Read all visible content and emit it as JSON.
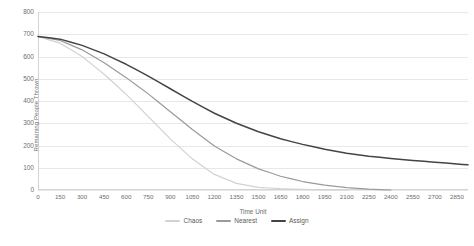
{
  "chart_data": {
    "type": "line",
    "title": "",
    "xlabel": "Time Unit",
    "ylabel": "Remaining People Thrown",
    "xlim": [
      0,
      2925
    ],
    "ylim": [
      0,
      800
    ],
    "grid": true,
    "legend_position": "bottom",
    "x_ticks": [
      0,
      150,
      300,
      450,
      600,
      750,
      900,
      1050,
      1200,
      1350,
      1500,
      1650,
      1800,
      1950,
      2100,
      2250,
      2400,
      2550,
      2700,
      2850
    ],
    "y_ticks": [
      0,
      100,
      200,
      300,
      400,
      500,
      600,
      700,
      800
    ],
    "series": [
      {
        "name": "Chaos",
        "color": "#d2d2d2",
        "x": [
          0,
          150,
          300,
          450,
          600,
          750,
          900,
          1050,
          1200,
          1350,
          1500,
          1650,
          1800,
          1950,
          2100
        ],
        "values": [
          690,
          660,
          600,
          520,
          430,
          330,
          230,
          140,
          70,
          30,
          12,
          6,
          3,
          1,
          0
        ]
      },
      {
        "name": "Nearest",
        "color": "#9a9a9a",
        "x": [
          0,
          150,
          300,
          450,
          600,
          750,
          900,
          1050,
          1200,
          1350,
          1500,
          1650,
          1800,
          1950,
          2100,
          2250,
          2400
        ],
        "values": [
          690,
          672,
          630,
          572,
          505,
          432,
          352,
          272,
          198,
          140,
          95,
          62,
          38,
          22,
          11,
          4,
          0
        ]
      },
      {
        "name": "Assign",
        "color": "#444444",
        "x": [
          0,
          150,
          300,
          450,
          600,
          750,
          900,
          1050,
          1200,
          1350,
          1500,
          1650,
          1800,
          1950,
          2100,
          2250,
          2400,
          2550,
          2700,
          2850,
          2925
        ],
        "values": [
          690,
          678,
          650,
          612,
          565,
          512,
          455,
          398,
          345,
          300,
          262,
          230,
          205,
          183,
          165,
          152,
          142,
          133,
          125,
          117,
          113
        ]
      }
    ]
  },
  "legend": {
    "items": [
      {
        "label": "Chaos"
      },
      {
        "label": "Nearest"
      },
      {
        "label": "Assign"
      }
    ]
  }
}
